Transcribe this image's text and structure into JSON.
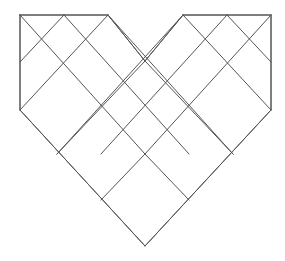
{
  "figure": {
    "canvas": {
      "width": 285,
      "height": 261,
      "background_color": "#ffffff"
    },
    "style": {
      "stroke_color": "#555555",
      "stroke_width": 1,
      "fill": "none"
    },
    "geometry": {
      "grid_type": "rotated-square-lattice",
      "half_step_x": 43.75,
      "half_step_y": 46.5,
      "origin_x": 145,
      "origin_y": 15,
      "note": "Lattice nodes sit at (origin_x + i*half_step_x, origin_y + j*half_step_y) with i+j even."
    },
    "outline_label": "heart-outline",
    "outline_points": "20,15 108,15 145,61 183,15 271,15 271,110 145,246 20,110 20,15",
    "segments": [
      {
        "name": "top-edge-left",
        "x1": 20,
        "y1": 15,
        "x2": 108,
        "y2": 15
      },
      {
        "name": "top-edge-right",
        "x1": 183,
        "y1": 15,
        "x2": 271,
        "y2": 15
      },
      {
        "name": "left-side-vertical",
        "x1": 20,
        "y1": 15,
        "x2": 20,
        "y2": 110
      },
      {
        "name": "right-side-vertical",
        "x1": 271,
        "y1": 15,
        "x2": 271,
        "y2": 110
      },
      {
        "name": "notch-left-diagonal",
        "x1": 108,
        "y1": 15,
        "x2": 145,
        "y2": 61
      },
      {
        "name": "notch-right-diagonal",
        "x1": 183,
        "y1": 15,
        "x2": 145,
        "y2": 61
      },
      {
        "name": "lower-left-edge",
        "x1": 20,
        "y1": 110,
        "x2": 145,
        "y2": 246
      },
      {
        "name": "lower-right-edge",
        "x1": 271,
        "y1": 110,
        "x2": 145,
        "y2": 246
      },
      {
        "name": "lattice-down-right-1",
        "x1": 20,
        "y1": 15,
        "x2": 145,
        "y2": 154
      },
      {
        "name": "lattice-down-right-2",
        "x1": 64,
        "y1": 15,
        "x2": 189,
        "y2": 154
      },
      {
        "name": "lattice-down-right-3",
        "x1": 108,
        "y1": 15,
        "x2": 233,
        "y2": 154
      },
      {
        "name": "lattice-down-right-4",
        "x1": 183,
        "y1": 15,
        "x2": 271,
        "y2": 110
      },
      {
        "name": "lattice-down-right-5",
        "x1": 227,
        "y1": 15,
        "x2": 271,
        "y2": 62
      },
      {
        "name": "lattice-down-left-1",
        "x1": 271,
        "y1": 15,
        "x2": 145,
        "y2": 154
      },
      {
        "name": "lattice-down-left-2",
        "x1": 227,
        "y1": 15,
        "x2": 101,
        "y2": 154
      },
      {
        "name": "lattice-down-left-3",
        "x1": 183,
        "y1": 15,
        "x2": 57,
        "y2": 154
      },
      {
        "name": "lattice-down-left-4",
        "x1": 108,
        "y1": 15,
        "x2": 20,
        "y2": 110
      },
      {
        "name": "lattice-down-left-5",
        "x1": 64,
        "y1": 15,
        "x2": 20,
        "y2": 62
      },
      {
        "name": "lattice-inner-up-right-1",
        "x1": 57,
        "y1": 154,
        "x2": 145,
        "y2": 61
      },
      {
        "name": "lattice-inner-up-right-2",
        "x1": 101,
        "y1": 200,
        "x2": 145,
        "y2": 154
      },
      {
        "name": "lattice-inner-up-left-1",
        "x1": 233,
        "y1": 154,
        "x2": 145,
        "y2": 61
      },
      {
        "name": "lattice-inner-up-left-2",
        "x1": 189,
        "y1": 200,
        "x2": 145,
        "y2": 154
      }
    ],
    "vertices": [
      {
        "name": "top-left-corner",
        "x": 20,
        "y": 15
      },
      {
        "name": "top-peak-left",
        "x": 108,
        "y": 15
      },
      {
        "name": "top-notch-center",
        "x": 145,
        "y": 61
      },
      {
        "name": "top-peak-right",
        "x": 183,
        "y": 15
      },
      {
        "name": "top-right-corner",
        "x": 271,
        "y": 15
      },
      {
        "name": "left-waist",
        "x": 20,
        "y": 110
      },
      {
        "name": "right-waist",
        "x": 271,
        "y": 110
      },
      {
        "name": "bottom-point",
        "x": 145,
        "y": 246
      }
    ]
  }
}
